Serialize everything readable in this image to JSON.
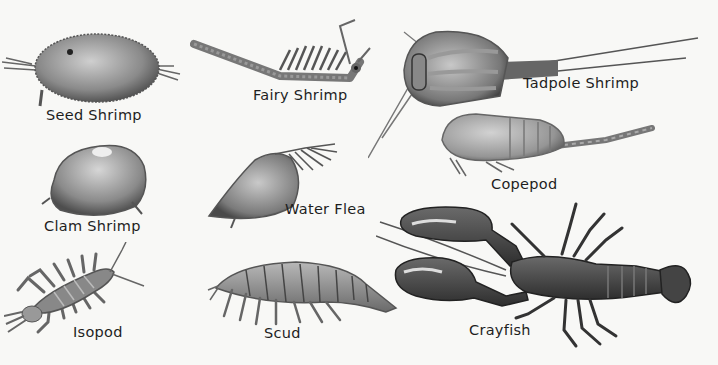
{
  "plate": {
    "background": "#f8f8f6",
    "ink_color": "#1e1e1e",
    "specimens": [
      {
        "id": "seed-shrimp",
        "label": "Seed Shrimp"
      },
      {
        "id": "fairy-shrimp",
        "label": "Fairy Shrimp"
      },
      {
        "id": "tadpole-shrimp",
        "label": "Tadpole Shrimp"
      },
      {
        "id": "clam-shrimp",
        "label": "Clam Shrimp"
      },
      {
        "id": "water-flea",
        "label": "Water Flea"
      },
      {
        "id": "copepod",
        "label": "Copepod"
      },
      {
        "id": "isopod",
        "label": "Isopod"
      },
      {
        "id": "scud",
        "label": "Scud"
      },
      {
        "id": "crayfish",
        "label": "Crayfish"
      }
    ]
  }
}
